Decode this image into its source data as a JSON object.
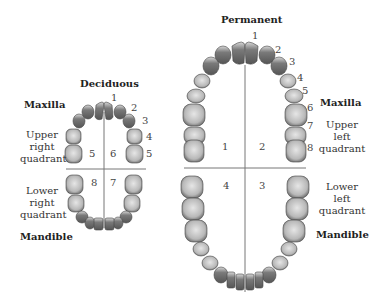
{
  "deciduous": {
    "title": "Deciduous",
    "maxilla": "Maxilla",
    "mandible": "Mandible",
    "upper_right": [
      "Upper",
      "right",
      "quadrant"
    ],
    "lower_right": [
      "Lower",
      "right",
      "quadrant"
    ],
    "tooth_numbers": [
      "1",
      "2",
      "3",
      "4",
      "5"
    ],
    "quadrants": {
      "q5": "5",
      "q6": "6",
      "q7": "7",
      "q8": "8"
    }
  },
  "permanent": {
    "title": "Permanent",
    "maxilla": "Maxilla",
    "mandible": "Mandible",
    "upper_left": [
      "Upper",
      "left",
      "quadrant"
    ],
    "lower_left": [
      "Lower",
      "left",
      "quadrant"
    ],
    "tooth_numbers": [
      "1",
      "2",
      "3",
      "4",
      "5",
      "6",
      "7",
      "8"
    ],
    "quadrants": {
      "q1": "1",
      "q2": "2",
      "q3": "3",
      "q4": "4"
    }
  },
  "colors": {
    "tooth_light": "#c8c8c8",
    "tooth_dark": "#6e6e6e",
    "line": "#777777"
  }
}
